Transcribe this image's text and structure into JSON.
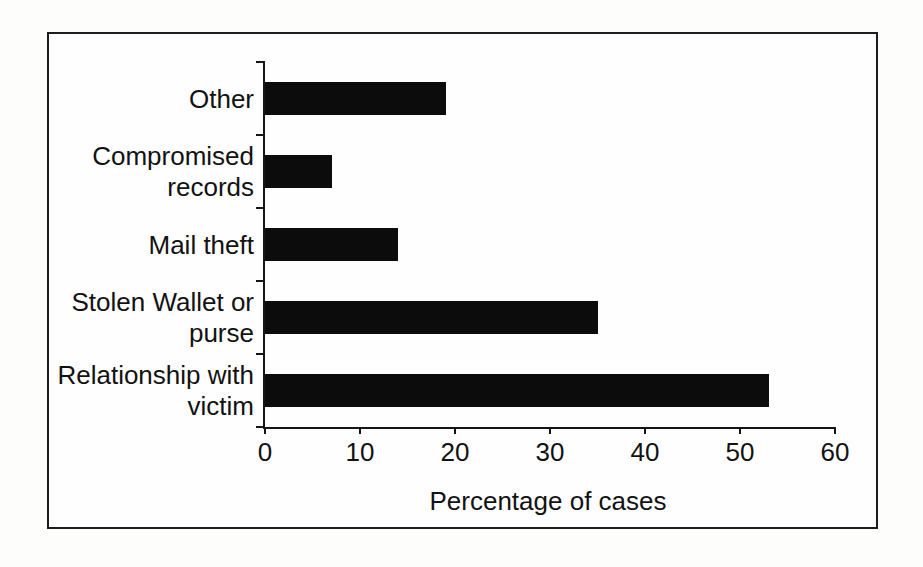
{
  "chart_data": {
    "type": "bar",
    "orientation": "horizontal",
    "title": "",
    "xlabel": "Percentage of cases",
    "ylabel": "",
    "categories": [
      "Other",
      "Compromised records",
      "Mail theft",
      "Stolen Wallet or purse",
      "Relationship with victim"
    ],
    "category_label_lines": [
      [
        "Other"
      ],
      [
        "Compromised",
        "records"
      ],
      [
        "Mail theft"
      ],
      [
        "Stolen Wallet or",
        "purse"
      ],
      [
        "Relationship with",
        "victim"
      ]
    ],
    "values": [
      19,
      7,
      14,
      35,
      53
    ],
    "xlim": [
      0,
      60
    ],
    "xticks": [
      0,
      10,
      20,
      30,
      40,
      50,
      60
    ],
    "grid": false,
    "legend": "none",
    "bar_color": "#0c0c0c",
    "axis_color": "#151515",
    "border_color": "#1d1d1d",
    "background_color": "#fefefe"
  }
}
